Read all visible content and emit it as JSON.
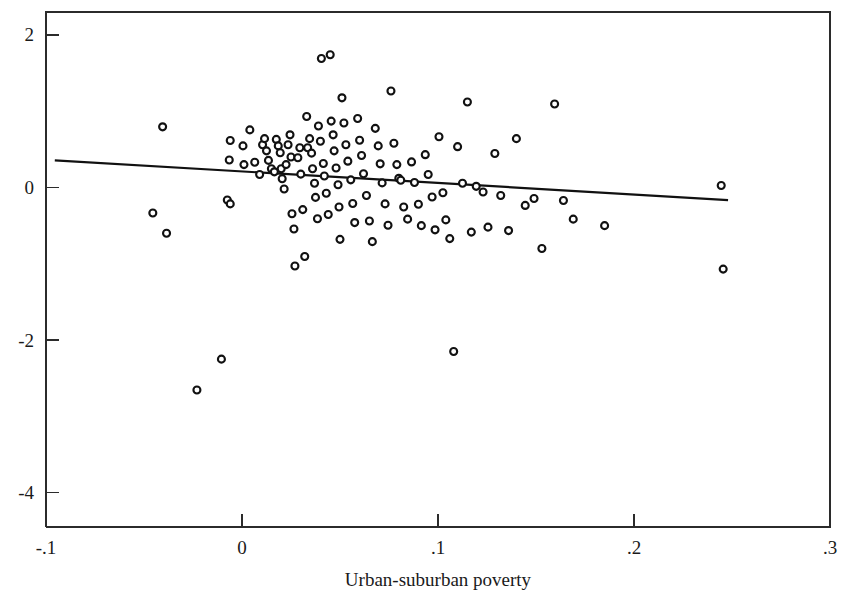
{
  "chart_data": {
    "type": "scatter",
    "title": "",
    "subtitle": "",
    "xlabel": "Urban-suburban poverty",
    "ylabel": "",
    "xlim": [
      -0.1,
      0.3
    ],
    "ylim": [
      -4.45,
      2.3
    ],
    "grid": false,
    "legend": null,
    "x_ticks": [
      -0.1,
      0,
      0.1,
      0.2,
      0.3
    ],
    "x_tick_labels": [
      "-.1",
      "0",
      ".1",
      ".2",
      ".3"
    ],
    "y_ticks": [
      2,
      0,
      -2,
      -4
    ],
    "y_tick_labels": [
      "2",
      "0",
      "-2",
      "-4"
    ],
    "marker": {
      "shape": "open-circle",
      "fill": "#ffffff",
      "edge_color": "#111111",
      "size_px": 7
    },
    "series": [
      {
        "name": "observations",
        "points": [
          [
            -0.0405,
            0.795
          ],
          [
            -0.0455,
            -0.335
          ],
          [
            -0.0385,
            -0.6
          ],
          [
            -0.023,
            -2.655
          ],
          [
            -0.0105,
            -2.25
          ],
          [
            -0.006,
            0.615
          ],
          [
            -0.0065,
            0.36
          ],
          [
            -0.0075,
            -0.165
          ],
          [
            -0.006,
            -0.215
          ],
          [
            0.0005,
            0.545
          ],
          [
            0.001,
            0.3
          ],
          [
            0.004,
            0.755
          ],
          [
            0.0065,
            0.33
          ],
          [
            0.009,
            0.17
          ],
          [
            0.0105,
            0.56
          ],
          [
            0.0115,
            0.64
          ],
          [
            0.0125,
            0.48
          ],
          [
            0.0135,
            0.355
          ],
          [
            0.015,
            0.245
          ],
          [
            0.0165,
            0.205
          ],
          [
            0.0175,
            0.63
          ],
          [
            0.0185,
            0.545
          ],
          [
            0.0195,
            0.455
          ],
          [
            0.02,
            0.245
          ],
          [
            0.0205,
            0.115
          ],
          [
            0.0215,
            -0.02
          ],
          [
            0.0225,
            0.3
          ],
          [
            0.0235,
            0.56
          ],
          [
            0.0245,
            0.69
          ],
          [
            0.025,
            0.4
          ],
          [
            0.0255,
            -0.345
          ],
          [
            0.0265,
            -0.545
          ],
          [
            0.027,
            -1.03
          ],
          [
            0.0285,
            0.39
          ],
          [
            0.0295,
            0.52
          ],
          [
            0.03,
            0.175
          ],
          [
            0.031,
            -0.29
          ],
          [
            0.032,
            -0.905
          ],
          [
            0.033,
            0.93
          ],
          [
            0.0335,
            0.52
          ],
          [
            0.0345,
            0.64
          ],
          [
            0.0355,
            0.45
          ],
          [
            0.036,
            0.245
          ],
          [
            0.037,
            0.055
          ],
          [
            0.0375,
            -0.13
          ],
          [
            0.0385,
            -0.41
          ],
          [
            0.039,
            0.805
          ],
          [
            0.04,
            0.605
          ],
          [
            0.0405,
            1.69
          ],
          [
            0.0415,
            0.315
          ],
          [
            0.042,
            0.15
          ],
          [
            0.043,
            -0.075
          ],
          [
            0.044,
            -0.355
          ],
          [
            0.045,
            1.74
          ],
          [
            0.0455,
            0.87
          ],
          [
            0.0465,
            0.69
          ],
          [
            0.047,
            0.48
          ],
          [
            0.048,
            0.255
          ],
          [
            0.049,
            0.035
          ],
          [
            0.0495,
            -0.255
          ],
          [
            0.05,
            -0.68
          ],
          [
            0.051,
            1.175
          ],
          [
            0.052,
            0.845
          ],
          [
            0.053,
            0.56
          ],
          [
            0.054,
            0.345
          ],
          [
            0.0555,
            0.1
          ],
          [
            0.0565,
            -0.21
          ],
          [
            0.0575,
            -0.46
          ],
          [
            0.059,
            0.905
          ],
          [
            0.06,
            0.62
          ],
          [
            0.061,
            0.42
          ],
          [
            0.062,
            0.18
          ],
          [
            0.0635,
            -0.105
          ],
          [
            0.065,
            -0.44
          ],
          [
            0.0665,
            -0.71
          ],
          [
            0.068,
            0.775
          ],
          [
            0.0695,
            0.545
          ],
          [
            0.0705,
            0.31
          ],
          [
            0.0715,
            0.06
          ],
          [
            0.073,
            -0.215
          ],
          [
            0.0745,
            -0.495
          ],
          [
            0.076,
            1.265
          ],
          [
            0.0775,
            0.58
          ],
          [
            0.079,
            0.3
          ],
          [
            0.08,
            0.12
          ],
          [
            0.081,
            0.095
          ],
          [
            0.0825,
            -0.255
          ],
          [
            0.0845,
            -0.415
          ],
          [
            0.0865,
            0.335
          ],
          [
            0.088,
            0.065
          ],
          [
            0.09,
            -0.22
          ],
          [
            0.0915,
            -0.5
          ],
          [
            0.0935,
            0.43
          ],
          [
            0.095,
            0.17
          ],
          [
            0.097,
            -0.125
          ],
          [
            0.0985,
            -0.555
          ],
          [
            0.1005,
            0.665
          ],
          [
            0.1025,
            -0.07
          ],
          [
            0.104,
            -0.425
          ],
          [
            0.106,
            -0.67
          ],
          [
            0.108,
            -2.15
          ],
          [
            0.11,
            0.535
          ],
          [
            0.1125,
            0.055
          ],
          [
            0.115,
            1.12
          ],
          [
            0.117,
            -0.585
          ],
          [
            0.1195,
            0.015
          ],
          [
            0.123,
            -0.06
          ],
          [
            0.1255,
            -0.52
          ],
          [
            0.129,
            0.445
          ],
          [
            0.132,
            -0.105
          ],
          [
            0.136,
            -0.565
          ],
          [
            0.14,
            0.64
          ],
          [
            0.1445,
            -0.235
          ],
          [
            0.149,
            -0.145
          ],
          [
            0.153,
            -0.8
          ],
          [
            0.1595,
            1.095
          ],
          [
            0.164,
            -0.17
          ],
          [
            0.169,
            -0.415
          ],
          [
            0.185,
            -0.5
          ],
          [
            0.2445,
            0.025
          ],
          [
            0.2455,
            -1.07
          ]
        ]
      }
    ],
    "fit_line": {
      "name": "linear fit",
      "x_start": -0.0955,
      "y_start": 0.355,
      "x_end": 0.248,
      "y_end": -0.165,
      "slope": -1.515,
      "intercept": 0.2105
    }
  }
}
